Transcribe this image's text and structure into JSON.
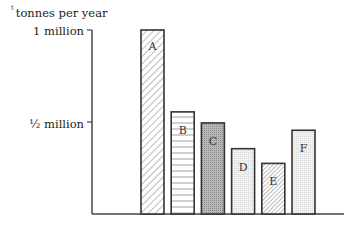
{
  "chart_data": {
    "type": "bar",
    "title": "",
    "xlabel": "",
    "ylabel": "tonnes per year",
    "categories": [
      "A",
      "B",
      "C",
      "D",
      "E",
      "F"
    ],
    "values": [
      1000000,
      555000,
      495000,
      355000,
      275000,
      455000
    ],
    "ylim": [
      0,
      1000000
    ],
    "yticks": [
      {
        "value": 500000,
        "label": "½ million"
      },
      {
        "value": 1000000,
        "label": "1 million"
      }
    ],
    "bar_patterns": [
      "diagonal-hatch",
      "horizontal-lines",
      "dark-stipple",
      "light-stipple",
      "diagonal-hatch",
      "light-stipple"
    ],
    "grid": false,
    "legend": null
  },
  "labels": {
    "ylabel": "tonnes per year",
    "ylabel_mark": "t",
    "tick_1m": "1 million",
    "tick_half": "½ million"
  }
}
